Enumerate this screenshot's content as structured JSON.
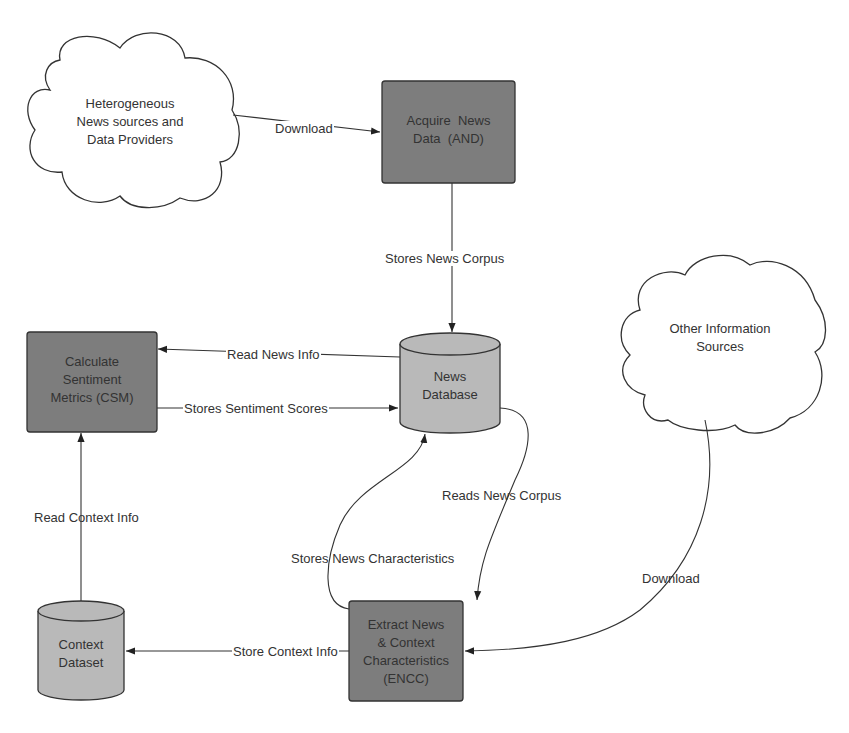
{
  "nodes": {
    "hetero_cloud": {
      "line1": "Heterogeneous",
      "line2": "News sources and",
      "line3": "Data Providers"
    },
    "and_box": {
      "line1": "Acquire  News",
      "line2": "Data  (AND)"
    },
    "news_db": {
      "line1": "News",
      "line2": "Database"
    },
    "csm_box": {
      "line1": "Calculate",
      "line2": "Sentiment",
      "line3": "Metrics (CSM)"
    },
    "other_cloud": {
      "line1": "Other Information",
      "line2": "Sources"
    },
    "context_db": {
      "line1": "Context",
      "line2": "Dataset"
    },
    "encc_box": {
      "line1": "Extract News",
      "line2": "& Context",
      "line3": "Characteristics",
      "line4": "(ENCC)"
    }
  },
  "edges": {
    "download_1": "Download",
    "stores_news_corpus": "Stores News Corpus",
    "read_news_info": "Read News Info",
    "stores_sentiment_scores": "Stores Sentiment Scores",
    "reads_news_corpus": "Reads News Corpus",
    "stores_news_characteristics": "Stores News Characteristics",
    "read_context_info": "Read Context Info",
    "store_context_info": "Store Context Info",
    "download_2": "Download"
  },
  "colors": {
    "process_fill": "#7d7d7d",
    "db_fill": "#b9b9b9",
    "stroke": "#333333"
  }
}
